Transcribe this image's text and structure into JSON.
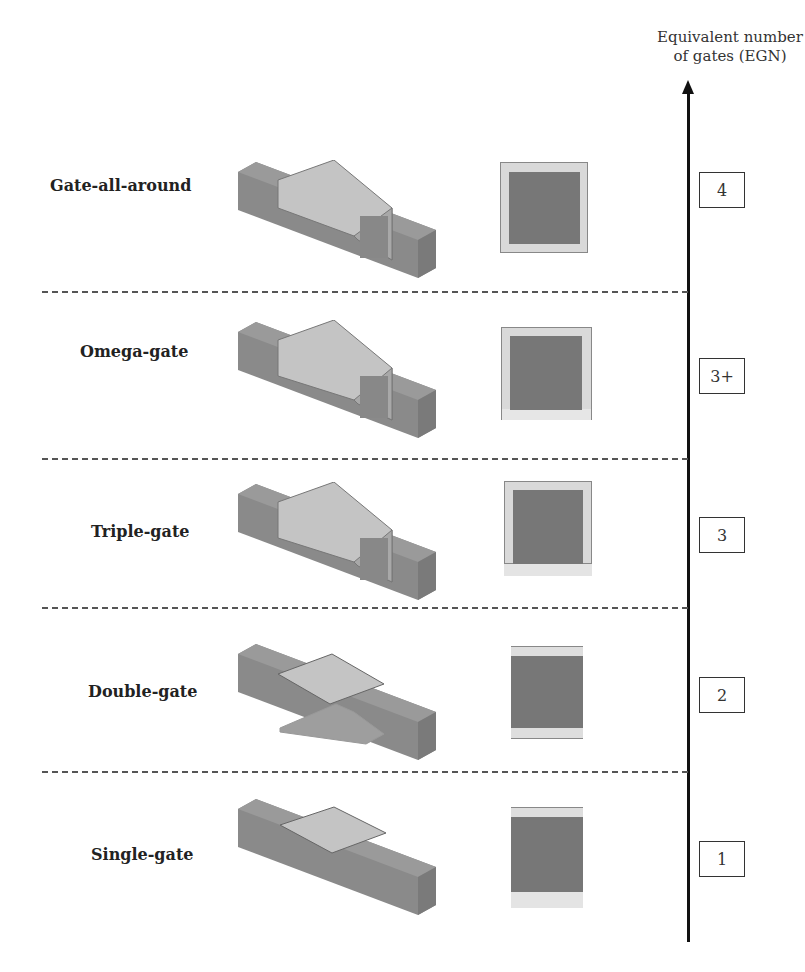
{
  "axis": {
    "title_line1": "Equivalent number",
    "title_line2": "of gates (EGN)"
  },
  "rows": [
    {
      "label": "Gate-all-around",
      "egn": "4"
    },
    {
      "label": "Omega-gate",
      "egn": "3+"
    },
    {
      "label": "Triple-gate",
      "egn": "3"
    },
    {
      "label": "Double-gate",
      "egn": "2"
    },
    {
      "label": "Single-gate",
      "egn": "1"
    }
  ],
  "colors": {
    "channel": "#777777",
    "gate": "#c8c8c8",
    "gate_dielectric": "#d9d9d9",
    "axis": "#111111",
    "divider": "#555555"
  }
}
